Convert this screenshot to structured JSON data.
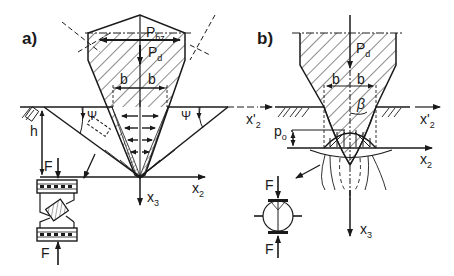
{
  "panels": [
    {
      "id": "a",
      "label": "a)",
      "symbols": {
        "horizontal_force": "P",
        "horizontal_force_sub": "bz",
        "vertical_force": "P",
        "vertical_force_sub": "d",
        "half_width_left": "b",
        "half_width_right": "b",
        "angle_left": "Ψ",
        "angle_right": "Ψ",
        "depth": "h",
        "axis_horizontal": "x",
        "axis_horizontal_sub": "2",
        "axis_vertical": "x",
        "axis_vertical_sub": "3",
        "force_top": "F",
        "force_bottom": "F"
      }
    },
    {
      "id": "b",
      "label": "b)",
      "symbols": {
        "vertical_force": "P",
        "vertical_force_sub": "d",
        "half_width_left": "b",
        "half_width_right": "b",
        "angle": "β",
        "pressure": "p",
        "pressure_sub": "o",
        "axis_prime_left": "x'",
        "axis_prime_left_sub": "2",
        "axis_prime_right": "x'",
        "axis_prime_right_sub": "2",
        "axis_horizontal": "x",
        "axis_horizontal_sub": "2",
        "axis_vertical": "x",
        "axis_vertical_sub": "3",
        "force_top": "F",
        "force_bottom": "F"
      }
    }
  ],
  "colors": {
    "ink": "#1a1a1a",
    "background": "#ffffff"
  }
}
